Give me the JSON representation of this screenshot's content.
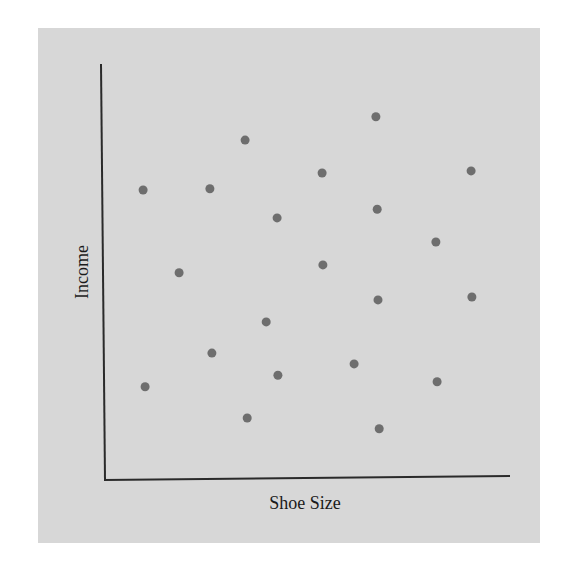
{
  "chart_data": {
    "type": "scatter",
    "title": "",
    "xlabel": "Shoe Size",
    "ylabel": "Income",
    "xlim": [
      0,
      100
    ],
    "ylim": [
      0,
      100
    ],
    "grid": false,
    "legend": null,
    "ticks": "none",
    "points": [
      {
        "x": 9.4,
        "y": 69.7
      },
      {
        "x": 25.9,
        "y": 70.0
      },
      {
        "x": 34.6,
        "y": 81.7
      },
      {
        "x": 42.5,
        "y": 63.0
      },
      {
        "x": 18.3,
        "y": 49.8
      },
      {
        "x": 66.9,
        "y": 87.3
      },
      {
        "x": 53.6,
        "y": 73.8
      },
      {
        "x": 90.4,
        "y": 74.3
      },
      {
        "x": 67.2,
        "y": 65.1
      },
      {
        "x": 81.7,
        "y": 57.2
      },
      {
        "x": 53.8,
        "y": 51.7
      },
      {
        "x": 67.4,
        "y": 43.3
      },
      {
        "x": 90.6,
        "y": 44.0
      },
      {
        "x": 39.8,
        "y": 38.0
      },
      {
        "x": 26.4,
        "y": 30.5
      },
      {
        "x": 42.7,
        "y": 25.2
      },
      {
        "x": 9.9,
        "y": 22.4
      },
      {
        "x": 35.1,
        "y": 14.9
      },
      {
        "x": 61.5,
        "y": 27.9
      },
      {
        "x": 82.0,
        "y": 23.6
      },
      {
        "x": 67.7,
        "y": 12.3
      }
    ],
    "colors": {
      "background": "#d7d7d7",
      "point": "#6e6e6e",
      "axis": "#2a2a2a"
    }
  }
}
